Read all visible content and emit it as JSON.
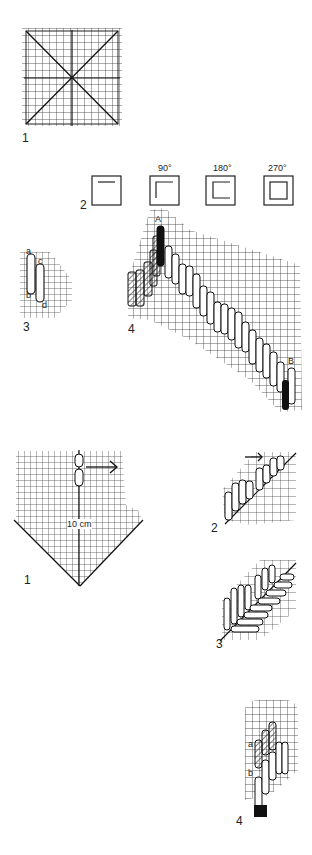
{
  "figures": {
    "fig1_top": {
      "label": "1",
      "description": "square grid with diagonals and center lines"
    },
    "fig2": {
      "label": "2",
      "squares": [
        {
          "angle": ""
        },
        {
          "angle": "90°"
        },
        {
          "angle": "180°"
        },
        {
          "angle": "270°"
        }
      ]
    },
    "fig3": {
      "label": "3",
      "points": [
        "a",
        "b",
        "c",
        "d"
      ]
    },
    "fig4": {
      "label": "4",
      "start_point": "A",
      "end_point": "B"
    },
    "fig1_bottom": {
      "label": "1",
      "measure": "10 cm"
    },
    "fig2_bottom": {
      "label": "2"
    },
    "fig3_bottom": {
      "label": "3"
    },
    "fig4_bottom": {
      "label": "4",
      "points": [
        "a",
        "b"
      ]
    }
  },
  "colors": {
    "ink": "#111111",
    "paper": "#ffffff",
    "hatch": "#555555"
  }
}
